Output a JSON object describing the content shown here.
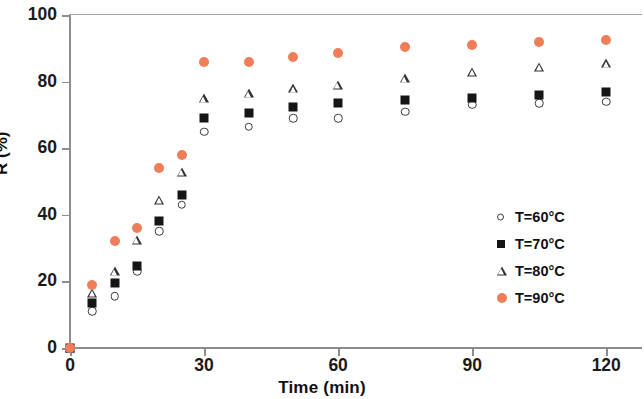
{
  "chart_data": {
    "type": "scatter",
    "title": "",
    "xlabel": "Time (min)",
    "ylabel": "R (%)",
    "xlim": [
      0,
      128
    ],
    "ylim": [
      0,
      100
    ],
    "xticks": [
      0,
      30,
      60,
      90,
      120
    ],
    "yticks": [
      0,
      20,
      40,
      60,
      80,
      100
    ],
    "grid": false,
    "legend_position": "right-inside",
    "x": [
      0,
      5,
      10,
      15,
      20,
      25,
      30,
      40,
      50,
      60,
      75,
      90,
      105,
      120
    ],
    "series": [
      {
        "name": "T=60°C",
        "marker": "open-circle",
        "color": "#3b3b3b",
        "values": [
          0,
          11,
          15.5,
          23,
          35,
          43,
          65,
          66.5,
          69,
          69,
          71,
          73,
          73.5,
          74
        ]
      },
      {
        "name": "T=70°C",
        "marker": "filled-square",
        "color": "#151515",
        "values": [
          0,
          13.5,
          19.5,
          24.5,
          38,
          46,
          69,
          70.5,
          72.5,
          73.5,
          74.5,
          75,
          76,
          77
        ]
      },
      {
        "name": "T=80°C",
        "marker": "open-triangle",
        "color": "#333333",
        "values": [
          0,
          16.5,
          23,
          32.5,
          44.5,
          53,
          75,
          76.5,
          78,
          79,
          81,
          83,
          84.5,
          85.5
        ]
      },
      {
        "name": "T=90°C",
        "marker": "filled-circle",
        "color": "#ee7d58",
        "values": [
          0,
          19,
          32,
          36,
          54,
          58,
          86,
          86,
          87.5,
          88.5,
          90.5,
          91,
          92,
          92.5
        ]
      }
    ]
  },
  "axes": {
    "x_title": "Time (min)",
    "y_title": "R (%)",
    "x_tick_labels": [
      "0",
      "30",
      "60",
      "90",
      "120"
    ],
    "y_tick_labels": [
      "0",
      "20",
      "40",
      "60",
      "80",
      "100"
    ]
  },
  "legend": {
    "items": [
      {
        "label": "T=60°C",
        "marker": "open-circle"
      },
      {
        "label": "T=70°C",
        "marker": "filled-square"
      },
      {
        "label": "T=80°C",
        "marker": "open-triangle"
      },
      {
        "label": "T=90°C",
        "marker": "filled-circle"
      }
    ]
  },
  "colors": {
    "series_90": "#ee7d58",
    "series_dark": "#151515",
    "axis": "#8d8d8d",
    "background": "#ffffff"
  }
}
